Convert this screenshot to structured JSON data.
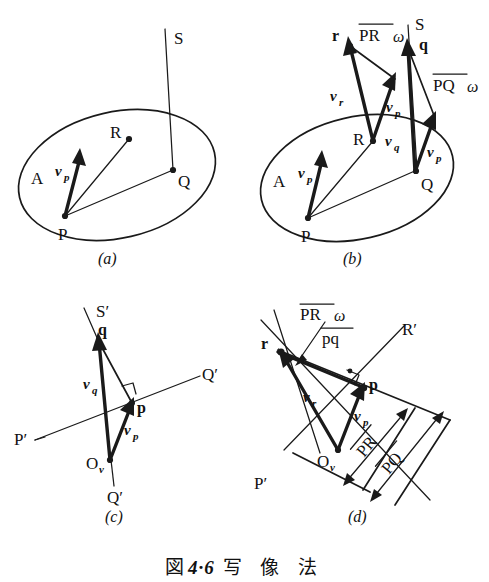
{
  "figure": {
    "caption_label": "図",
    "caption_number": "4·6",
    "caption_title": "写 像 法",
    "caption_full": "図 4·6  写 像 法"
  },
  "panels": [
    {
      "id": "a",
      "caption": "(a)",
      "labels": {
        "region": "A",
        "point_p": "P",
        "point_q": "Q",
        "point_r": "R",
        "point_s": "S",
        "vector_vp": "v",
        "vector_vp_sub": "p"
      }
    },
    {
      "id": "b",
      "caption": "(b)",
      "labels": {
        "region": "A",
        "point_p": "P",
        "point_q": "Q",
        "point_r": "R",
        "point_s": "S",
        "point_r_img": "r",
        "point_q_img": "q",
        "vector_vp": "v",
        "vector_vp_sub": "p",
        "vector_vq": "v",
        "vector_vq_sub": "q",
        "vector_vr": "v",
        "vector_vr_sub": "r",
        "vector_vp2": "v",
        "vector_vp2_sub": "p",
        "vector_vp3": "v",
        "vector_vp3_sub": "p",
        "pr_omega_bar": "PR",
        "pr_omega_sym": "ω",
        "pq_omega_bar": "PQ",
        "pq_omega_sym": "ω"
      }
    },
    {
      "id": "c",
      "caption": "(c)",
      "labels": {
        "point_s_prime": "S′",
        "point_q_img": "q",
        "point_p_img": "p",
        "point_ov": "O",
        "point_ov_sub": "v",
        "axis_p_prime": "P′",
        "axis_q_prime_right": "Q′",
        "axis_q_prime_bottom": "Q′",
        "vector_vq": "v",
        "vector_vq_sub": "q",
        "vector_vp": "v",
        "vector_vp_sub": "p"
      }
    },
    {
      "id": "d",
      "caption": "(d)",
      "labels": {
        "point_r_img": "r",
        "point_p_img": "p",
        "point_ov": "O",
        "point_ov_sub": "v",
        "axis_p_prime": "P′",
        "axis_r_prime": "R′",
        "ratio_numerator": "PR",
        "ratio_omega": "ω",
        "ratio_denominator": "pq",
        "len_pr": "PR",
        "len_pq": "PQ",
        "vector_vr": "v",
        "vector_vr_sub": "r",
        "vector_vp": "v",
        "vector_vp_sub": "p"
      }
    }
  ],
  "colors": {
    "ink": "#1a1a1a",
    "background": "#ffffff"
  }
}
